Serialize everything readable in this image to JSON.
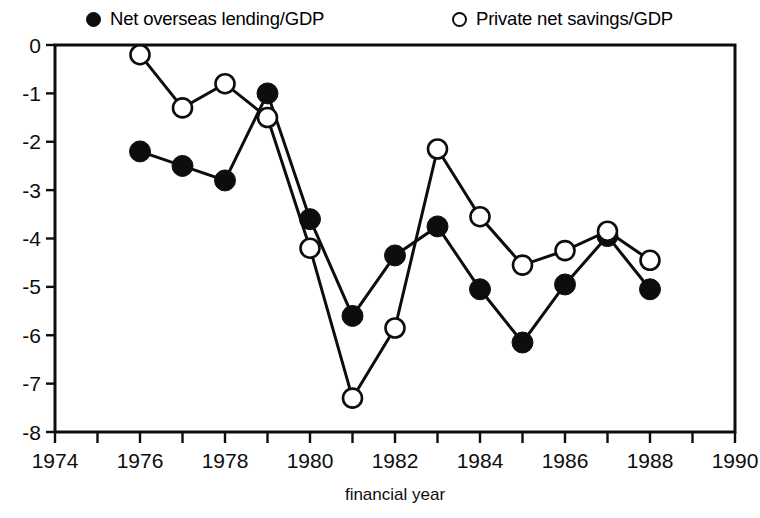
{
  "chart_data": {
    "type": "line",
    "title": "",
    "xlabel": "financial year",
    "ylabel": "",
    "xlim": [
      1974,
      1990
    ],
    "ylim": [
      -8,
      0
    ],
    "xticks": [
      1974,
      1976,
      1978,
      1980,
      1982,
      1984,
      1986,
      1988,
      1990
    ],
    "xtick_labels": [
      "1974",
      "1976",
      "1978",
      "1980",
      "1982",
      "1984",
      "1986",
      "1988",
      "1990"
    ],
    "xminor_step": 1,
    "yticks": [
      0,
      -1,
      -2,
      -3,
      -4,
      -5,
      -6,
      -7,
      -8
    ],
    "ytick_labels": [
      "0",
      "-1",
      "-2",
      "-3",
      "-4",
      "-5",
      "-6",
      "-7",
      "-8"
    ],
    "grid": false,
    "legend_position": "above-plot",
    "x": [
      1976,
      1977,
      1978,
      1979,
      1980,
      1981,
      1982,
      1983,
      1984,
      1985,
      1986,
      1987,
      1988
    ],
    "series": [
      {
        "name": "Net overseas lending/GDP",
        "marker": "filled-circle",
        "color": "#0d0d0d",
        "values": [
          -2.2,
          -2.5,
          -2.8,
          -1.0,
          -3.6,
          -5.6,
          -4.35,
          -3.75,
          -5.05,
          -6.15,
          -4.95,
          -3.95,
          -5.05
        ]
      },
      {
        "name": "Private net savings/GDP",
        "marker": "open-circle",
        "color": "#0d0d0d",
        "values": [
          -0.2,
          -1.3,
          -0.8,
          -1.5,
          -4.2,
          -7.3,
          -5.85,
          -2.15,
          -3.55,
          -4.55,
          -4.25,
          -3.85,
          -4.45
        ]
      }
    ]
  },
  "legend": {
    "entries": [
      {
        "label": "Net overseas lending/GDP",
        "marker": "filled-circle-icon"
      },
      {
        "label": "Private net savings/GDP",
        "marker": "open-circle-icon"
      }
    ]
  }
}
